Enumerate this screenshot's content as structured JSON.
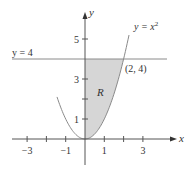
{
  "chart_data": {
    "type": "area",
    "title": "",
    "xlabel": "x",
    "ylabel": "y",
    "xlim": [
      -4,
      4.8
    ],
    "ylim": [
      -1.3,
      6.3
    ],
    "grid": false,
    "x_ticks": [
      -3,
      -2,
      -1,
      1,
      2,
      3
    ],
    "x_tick_labels": [
      "-3",
      "-1",
      "1",
      "3"
    ],
    "y_ticks": [
      1,
      2,
      3,
      4,
      5
    ],
    "y_tick_labels": [
      "1",
      "3",
      "5"
    ],
    "series": [
      {
        "name": "y = x²",
        "type": "curve",
        "expression": "y = x^2",
        "x_range": [
          -1.45,
          2.28
        ]
      },
      {
        "name": "y = 4",
        "type": "horizontal_line",
        "y": 4,
        "x_range": [
          -3.8,
          4.3
        ]
      }
    ],
    "region": {
      "label": "R",
      "bounds": "between x = 0, y = x^2 and y = 4",
      "x_range": [
        0,
        2
      ],
      "fill": "#d6d6d6"
    },
    "annotations": [
      {
        "text": "(2, 4)",
        "x": 2,
        "y": 4
      },
      {
        "text": "y = x²",
        "x": 2.5,
        "y": 5.6
      },
      {
        "text": "y = 4",
        "x": -3.8,
        "y": 4.2
      },
      {
        "text": "R",
        "x": 0.6,
        "y": 2.4
      }
    ]
  },
  "labels": {
    "x_axis": "x",
    "y_axis": "y",
    "curve_label_base": "y = x",
    "curve_label_exp": "2",
    "line_label": "y = 4",
    "point_label": "(2, 4)",
    "region_label": "R",
    "x_ticks": {
      "neg3": "−3",
      "neg1": "−1",
      "pos1": "1",
      "pos3": "3"
    },
    "y_ticks": {
      "one": "1",
      "three": "3",
      "five": "5"
    }
  },
  "colors": {
    "axis": "#555555",
    "curve": "#8a8a8a",
    "region_fill": "#d6d6d6",
    "text": "#333333"
  }
}
